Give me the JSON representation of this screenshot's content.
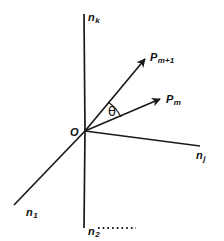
{
  "figure": {
    "type": "vector-diagram",
    "background_color": "#ffffff",
    "stroke_color": "#1a1a1a",
    "origin_label": "O"
  },
  "axes": [
    {
      "id": "n-k",
      "base": "n",
      "subscript": "k",
      "label": "n_k",
      "direction": "up-vertical",
      "from": [
        85,
        131
      ],
      "to": [
        84,
        14
      ]
    },
    {
      "id": "n-2",
      "base": "n",
      "subscript": "2",
      "label": "n_2",
      "direction": "down-vertical",
      "from": [
        85,
        131
      ],
      "to": [
        84,
        228
      ]
    },
    {
      "id": "n-1",
      "base": "n",
      "subscript": "1",
      "label": "n_1",
      "direction": "down-left",
      "from": [
        85,
        131
      ],
      "to": [
        14,
        205
      ]
    },
    {
      "id": "n-j",
      "base": "n",
      "subscript": "j",
      "label": "n_j",
      "direction": "right-slightly-down",
      "from": [
        85,
        131
      ],
      "to": [
        200,
        146
      ]
    }
  ],
  "vectors": [
    {
      "id": "p-m-plus-1",
      "base": "P",
      "subscript": "m+1",
      "label": "P_m+1",
      "from": [
        85,
        131
      ],
      "to": [
        148,
        56
      ],
      "arrowhead": "solid"
    },
    {
      "id": "p-m",
      "base": "P",
      "subscript": "m",
      "label": "P_m",
      "from": [
        85,
        131
      ],
      "to": [
        163,
        97
      ],
      "arrowhead": "solid"
    }
  ],
  "angle": {
    "id": "theta",
    "symbol": "θ",
    "between": [
      "p-m-plus-1",
      "p-m"
    ],
    "vertex": [
      85,
      131
    ]
  },
  "dotted_segment": {
    "id": "n2-dotted-continuation",
    "from": [
      97,
      228
    ],
    "to": [
      137,
      228
    ],
    "style": "dotted",
    "dot_count": 8
  }
}
